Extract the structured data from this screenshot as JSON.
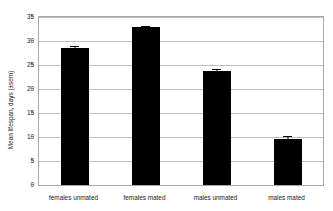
{
  "figure": {
    "caption_remnant": "",
    "background_color": "#ffffff",
    "bar_color": "#000000",
    "gridline_color": "#bdbdbd",
    "axis_color": "#a8a8a8"
  },
  "chart_data": {
    "type": "bar",
    "title": "",
    "xlabel": "",
    "ylabel": "Mean lifespan, days (±sem)",
    "categories": [
      "females unmated",
      "females mated",
      "males unmated",
      "males mated"
    ],
    "values": [
      28.5,
      32.9,
      23.8,
      9.6
    ],
    "errors": [
      0.4,
      0.3,
      0.3,
      0.7
    ],
    "ylim": [
      0,
      35
    ],
    "ytick_labels": [
      "0",
      "5",
      "10",
      "15",
      "20",
      "25",
      "30",
      "35"
    ],
    "ytick_values": [
      0,
      5,
      10,
      15,
      20,
      25,
      30,
      35
    ],
    "grid": true,
    "legend": false,
    "legend_position": "none"
  }
}
